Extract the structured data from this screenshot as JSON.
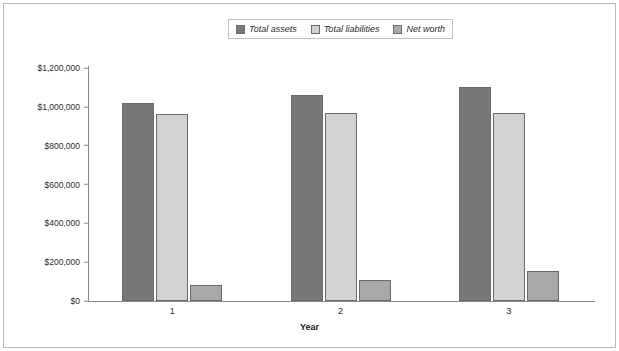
{
  "chart_data": {
    "type": "bar",
    "title": "",
    "xlabel": "Year",
    "ylabel": "",
    "categories": [
      "1",
      "2",
      "3"
    ],
    "ylim": [
      0,
      1200000
    ],
    "ytick_values": [
      0,
      200000,
      400000,
      600000,
      800000,
      1000000,
      1200000
    ],
    "ytick_labels": [
      "$0",
      "$200,000",
      "$400,000",
      "$600,000",
      "$800,000",
      "$1,000,000",
      "$1,200,000"
    ],
    "grid": false,
    "legend_position": "top-center",
    "series": [
      {
        "name": "Total assets",
        "color": "#787878",
        "values": [
          1020000,
          1060000,
          1100000
        ]
      },
      {
        "name": "Total liabilities",
        "color": "#d2d2d2",
        "values": [
          965000,
          970000,
          970000
        ]
      },
      {
        "name": "Net worth",
        "color": "#a8a8a8",
        "values": [
          80000,
          110000,
          155000
        ]
      }
    ]
  },
  "axis": {
    "x_title": "Year"
  },
  "colors": {
    "frame": "#b9b9b9",
    "axis": "#8a8a8a",
    "bar_outline": "#6b6b6b",
    "text": "#2b2b2b"
  }
}
